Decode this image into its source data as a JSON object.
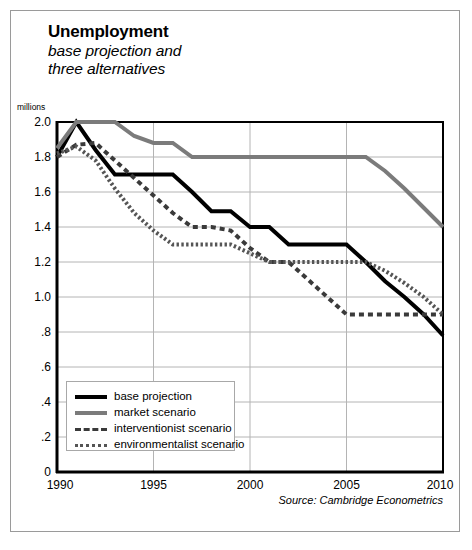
{
  "figure": {
    "title": "Unemployment",
    "subtitle_lines": [
      "base projection and",
      "three alternatives"
    ],
    "source": "Source: Cambridge Econometrics",
    "unit_label": "millions"
  },
  "colors": {
    "base_projection": "#000000",
    "market_scenario": "#7b7b7b",
    "interventionist_scenario": "#3a3a3a",
    "environmentalist_scenario": "#555555",
    "gridline": "#b4b4b4",
    "axis": "#000000",
    "frame": "#9a9a9a"
  },
  "legend": {
    "items": [
      {
        "label": "base projection",
        "key": "base_projection"
      },
      {
        "label": "market scenario",
        "key": "market_scenario"
      },
      {
        "label": "interventionist scenario",
        "key": "interventionist_scenario"
      },
      {
        "label": "environmentalist scenario",
        "key": "environmentalist_scenario"
      }
    ]
  },
  "chart_data": {
    "type": "line",
    "title": "Unemployment",
    "subtitle": "base projection and three alternatives",
    "xlabel": "",
    "ylabel": "millions",
    "xlim": [
      1990,
      2010
    ],
    "ylim": [
      0,
      2.0
    ],
    "grid": true,
    "legend_position": "inside-bottom-left",
    "source": "Source: Cambridge Econometrics",
    "x_tick_labels": [
      "1990",
      "1995",
      "2000",
      "2005",
      "2010"
    ],
    "x_ticks": [
      1990,
      1995,
      2000,
      2005,
      2010
    ],
    "y_tick_labels": [
      "0",
      ".2",
      ".4",
      ".6",
      ".8",
      "1.0",
      "1.2",
      "1.4",
      "1.6",
      "1.8",
      "2.0"
    ],
    "y_ticks": [
      0,
      0.2,
      0.4,
      0.6,
      0.8,
      1.0,
      1.2,
      1.4,
      1.6,
      1.8,
      2.0
    ],
    "x": [
      1990,
      1991,
      1992,
      1993,
      1994,
      1995,
      1996,
      1997,
      1998,
      1999,
      2000,
      2001,
      2002,
      2003,
      2004,
      2005,
      2006,
      2007,
      2008,
      2009,
      2010
    ],
    "series": [
      {
        "name": "base projection",
        "style": "solid",
        "color": "#000000",
        "width": 4,
        "values": [
          1.8,
          2.0,
          1.84,
          1.7,
          1.7,
          1.7,
          1.7,
          1.6,
          1.49,
          1.49,
          1.4,
          1.4,
          1.3,
          1.3,
          1.3,
          1.3,
          1.2,
          1.09,
          1.0,
          0.9,
          0.78
        ]
      },
      {
        "name": "market scenario",
        "style": "solid",
        "color": "#7b7b7b",
        "width": 4,
        "values": [
          1.85,
          2.0,
          2.0,
          2.0,
          1.92,
          1.88,
          1.88,
          1.8,
          1.8,
          1.8,
          1.8,
          1.8,
          1.8,
          1.8,
          1.8,
          1.8,
          1.8,
          1.72,
          1.62,
          1.51,
          1.4
        ]
      },
      {
        "name": "interventionist scenario",
        "style": "dashed",
        "color": "#3a3a3a",
        "width": 4,
        "values": [
          1.8,
          1.87,
          1.88,
          1.78,
          1.68,
          1.58,
          1.48,
          1.4,
          1.4,
          1.38,
          1.28,
          1.2,
          1.2,
          1.1,
          1.0,
          0.9,
          0.9,
          0.9,
          0.9,
          0.9,
          0.9
        ]
      },
      {
        "name": "environmentalist scenario",
        "style": "dotted",
        "color": "#555555",
        "width": 4,
        "values": [
          1.82,
          1.86,
          1.78,
          1.62,
          1.48,
          1.38,
          1.3,
          1.3,
          1.3,
          1.3,
          1.25,
          1.2,
          1.2,
          1.2,
          1.2,
          1.2,
          1.2,
          1.15,
          1.08,
          1.0,
          0.9
        ]
      }
    ]
  }
}
